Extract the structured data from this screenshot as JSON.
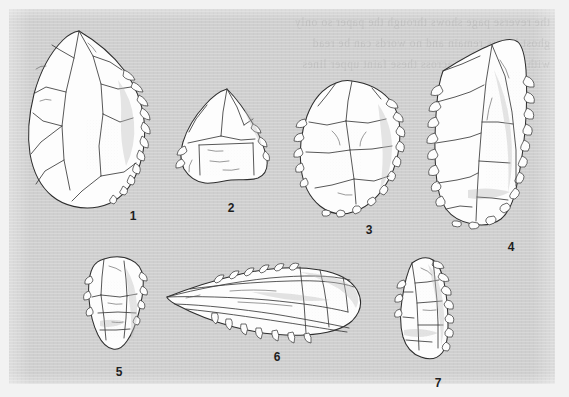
{
  "figure": {
    "kind": "archaeological-plate",
    "medium": "scanned printed page",
    "plate_background_color": "#cfcfcf",
    "page_background_color": "#f2f2f2",
    "ink_color": "#2b2b2b",
    "artefact_fill_color": "#fdfdfd",
    "width_px": 569,
    "height_px": 397
  },
  "bleedthrough": {
    "visible": true,
    "text": "the reverse page shows through the paper so only\nghost letters remain and no words can be read\nwith any certainty across these faint upper lines"
  },
  "artefacts": [
    {
      "number": "1",
      "label_x": 133,
      "label_y": 210,
      "description": "large ovate biface point, pointed apex, retouched right margin",
      "row": "top"
    },
    {
      "number": "2",
      "label_x": 231,
      "label_y": 202,
      "description": "small triangular flake with transverse break and retouch",
      "row": "top"
    },
    {
      "number": "3",
      "label_x": 369,
      "label_y": 224,
      "description": "rounded ovate side scraper with scalloped retouch",
      "row": "top"
    },
    {
      "number": "4",
      "label_x": 511,
      "label_y": 241,
      "description": "large rectangular flake, heavy bilateral retouch",
      "row": "top"
    },
    {
      "number": "5",
      "label_x": 119,
      "label_y": 366,
      "description": "small irregular flake with cortex remnant",
      "row": "bottom"
    },
    {
      "number": "6",
      "label_x": 277,
      "label_y": 351,
      "description": "elongated laurel-leaf blade point, tip to the left",
      "row": "bottom"
    },
    {
      "number": "7",
      "label_x": 438,
      "label_y": 377,
      "description": "narrow elongated flake with denticulate right edge",
      "row": "bottom"
    }
  ]
}
